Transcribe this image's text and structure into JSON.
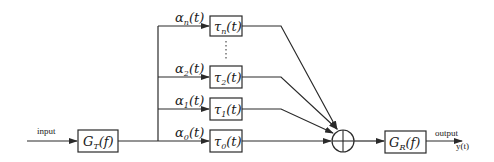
{
  "diagram": {
    "type": "block-diagram",
    "title": "",
    "input": {
      "label": "input"
    },
    "output": {
      "label": "output",
      "signal": "y(t)"
    },
    "transmit_filter": {
      "symbol": "G",
      "subscript": "T",
      "arg": "(f)"
    },
    "receive_filter": {
      "symbol": "G",
      "subscript": "R",
      "arg": "(f)"
    },
    "summer": {
      "symbol": "⊕"
    },
    "branches": [
      {
        "id": "n",
        "gain_symbol": "α",
        "gain_sub": "n",
        "gain_arg": "(t)",
        "delay_symbol": "τ",
        "delay_sub": "n",
        "delay_arg": "(t)"
      },
      {
        "id": "2",
        "gain_symbol": "α",
        "gain_sub": "2",
        "gain_arg": "(t)",
        "delay_symbol": "τ",
        "delay_sub": "2",
        "delay_arg": "(t)"
      },
      {
        "id": "1",
        "gain_symbol": "α",
        "gain_sub": "1",
        "gain_arg": "(t)",
        "delay_symbol": "τ",
        "delay_sub": "1",
        "delay_arg": "(t)"
      },
      {
        "id": "0",
        "gain_symbol": "α",
        "gain_sub": "0",
        "gain_arg": "(t)",
        "delay_symbol": "τ",
        "delay_sub": "0",
        "delay_arg": "(t)"
      }
    ],
    "ellipsis": "⋮",
    "colors": {
      "line": "#2a2a2a",
      "background": "#ffffff"
    }
  }
}
